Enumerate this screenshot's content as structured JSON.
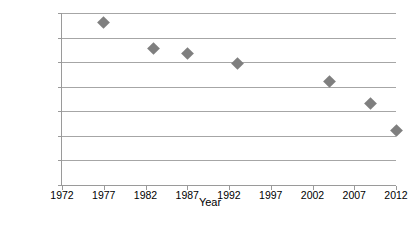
{
  "chart_data": {
    "type": "scatter",
    "title": "",
    "xlabel": "Year",
    "ylabel": "Headcount (%)",
    "xlim": [
      1972,
      2012
    ],
    "ylim": [
      0.0,
      70.0
    ],
    "grid": "horizontal",
    "legend": "none",
    "marker": {
      "shape": "diamond",
      "color": "#7f7f7f",
      "size_px": 9
    },
    "axis_color": "#9a9a9a",
    "gridline_color": "#a6a6a6",
    "x_ticks": [
      1972,
      1977,
      1982,
      1987,
      1992,
      1997,
      2002,
      2007,
      2012
    ],
    "x_tick_labels": [
      "1972",
      "1977",
      "1982",
      "1987",
      "1992",
      "1997",
      "2002",
      "2007",
      "2012"
    ],
    "y_ticks": [
      0.0,
      10.0,
      20.0,
      30.0,
      40.0,
      50.0,
      60.0,
      70.0
    ],
    "y_tick_labels": [
      "0.0",
      "10.0",
      "20.0",
      "30.0",
      "40.0",
      "50.0",
      "60.0",
      "70.0"
    ],
    "series": [
      {
        "name": "Headcount",
        "x": [
          1977,
          1983,
          1987,
          1993,
          2004,
          2009,
          2012
        ],
        "values": [
          66.2,
          55.4,
          53.6,
          49.4,
          42.2,
          33.2,
          22.3
        ]
      }
    ]
  }
}
